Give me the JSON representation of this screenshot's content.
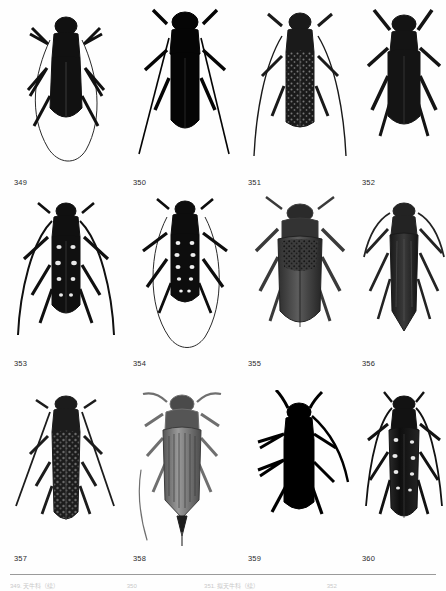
{
  "page": {
    "kind": "entomological-plate",
    "background_color": "#fefefe",
    "label_color": "#2b2b2b",
    "rule_color": "#9a9a9a",
    "columns": 4,
    "rows": 3,
    "figure_count": 12
  },
  "rows": [
    {
      "row_index": 1,
      "figures": [
        {
          "label": "349",
          "body_color": "#111111",
          "form": "elongate-cerambycid",
          "notes": "dark beetle, long antennae sweeping down and meeting in a loop below body"
        },
        {
          "label": "350",
          "body_color": "#050505",
          "form": "elongate-cerambycid",
          "notes": "solid black slender beetle, long straight antennae trailing to lower left and right"
        },
        {
          "label": "351",
          "body_color": "#1a1a1a",
          "form": "elongate-cerambycid",
          "notes": "mottled speckled elytra, long curving antennae"
        },
        {
          "label": "352",
          "body_color": "#141414",
          "form": "broad-cerambycid",
          "notes": "broad dark beetle, short thick antennae, stout legs"
        }
      ]
    },
    {
      "row_index": 2,
      "figures": [
        {
          "label": "353",
          "body_color": "#101010",
          "form": "spotted-cerambycid",
          "notes": "white spots on dark elytra, very long antennae curving outward"
        },
        {
          "label": "354",
          "body_color": "#0d0d0d",
          "form": "spotted-cerambycid",
          "notes": "white spotted elytra, extremely long antennae looping below the body"
        },
        {
          "label": "355",
          "body_color": "#4a4a4a",
          "form": "broad-prionid",
          "notes": "broad grey beetle with textured granulate shoulders, short antennae"
        },
        {
          "label": "356",
          "body_color": "#232323",
          "form": "elongate-cerambycid",
          "notes": "dark elongate beetle with pointed abdomen tip and striated elytra"
        }
      ]
    },
    {
      "row_index": 3,
      "figures": [
        {
          "label": "357",
          "body_color": "#1c1c1c",
          "form": "elongate-cerambycid",
          "notes": "mottled elytra, long straight antennae angling down to both sides"
        },
        {
          "label": "358",
          "body_color": "#6f6f6f",
          "form": "elongate-tenebrionid",
          "notes": "light grey-brown beetle, strongly striated elytra, pointed apex"
        },
        {
          "label": "359",
          "body_color": "#000000",
          "form": "stout-cerambycid",
          "notes": "solid black silhouette, long antenna sweeping right"
        },
        {
          "label": "360",
          "body_color": "#121212",
          "form": "spotted-cerambycid",
          "notes": "white spots along dark elytra, long antennae arcing outward"
        }
      ]
    }
  ],
  "footer": {
    "caption_clipped": true,
    "caption_note": "Caption line clipped at page edge; glyph tops only, illegible",
    "caption_fragments": [
      "349. 天牛科（续）",
      "350",
      "351. 拟天牛科（续）",
      "352"
    ]
  }
}
